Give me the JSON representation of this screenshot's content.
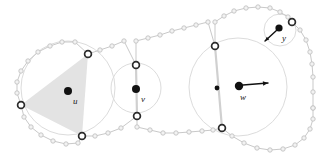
{
  "figure": {
    "kind": "geometric-diagram",
    "background_color": "#ffffff",
    "width": 321,
    "height": 155
  },
  "colors": {
    "boundary_stroke": "#c9c9c9",
    "small_vertex_stroke": "#c2c2c2",
    "small_vertex_fill": "#f2f2f2",
    "major_vertex_stroke": "#2b2b2b",
    "major_vertex_fill": "#ffffff",
    "disk_stroke": "#dcdcdc",
    "shaded_triangle_fill": "#e3e3e3",
    "chord_stroke": "#d0d0d0",
    "marker_fill": "#111111",
    "arrow_stroke": "#111111",
    "label_color": "#1a1a1a"
  },
  "labels": {
    "u": "u",
    "v": "v",
    "w": "w",
    "y": "y"
  },
  "points": {
    "u": {
      "label": "u",
      "x": 68,
      "y": 91,
      "radius": 4.0,
      "label_x": 73,
      "label_y": 97
    },
    "v": {
      "label": "v",
      "x": 136,
      "y": 89,
      "radius": 4.0,
      "label_x": 141,
      "label_y": 95
    },
    "w": {
      "label": "w",
      "x": 239,
      "y": 86,
      "radius": 4.2,
      "label_x": 240,
      "label_y": 93
    },
    "y": {
      "label": "y",
      "x": 279,
      "y": 28,
      "radius": 3.6,
      "label_x": 282,
      "label_y": 34
    },
    "w_secondary": {
      "label": "",
      "x": 217,
      "y": 88,
      "radius": 2.4
    }
  },
  "arrows": [
    {
      "name": "w-vector",
      "from_x": 243,
      "from_y": 85,
      "to_x": 268,
      "to_y": 83,
      "head_size": 5.5
    },
    {
      "name": "y-vector",
      "from_x": 277,
      "from_y": 30,
      "to_x": 265,
      "to_y": 41,
      "head_size": 4.5
    }
  ],
  "disks": [
    {
      "name": "disk-u",
      "cx": 68,
      "cy": 88,
      "r": 47
    },
    {
      "name": "disk-v",
      "cx": 136,
      "cy": 88,
      "r": 25
    },
    {
      "name": "disk-w",
      "cx": 238,
      "cy": 87,
      "r": 49
    },
    {
      "name": "disk-y",
      "cx": 280,
      "cy": 30,
      "r": 16
    }
  ],
  "major_vertices": [
    {
      "name": "vertex-left",
      "x": 21,
      "y": 105
    },
    {
      "name": "vertex-upper-left",
      "x": 88,
      "y": 54
    },
    {
      "name": "vertex-lower-left",
      "x": 82,
      "y": 136
    },
    {
      "name": "vertex-mid-top",
      "x": 136,
      "y": 65
    },
    {
      "name": "vertex-mid-bottom",
      "x": 137,
      "y": 116
    },
    {
      "name": "vertex-upper-right",
      "x": 215,
      "y": 46
    },
    {
      "name": "vertex-lower-right",
      "x": 222,
      "y": 128
    },
    {
      "name": "vertex-y-top",
      "x": 292,
      "y": 22
    }
  ],
  "shaded_triangle": {
    "name": "shaded-triangle-u",
    "vertices": [
      [
        21,
        105
      ],
      [
        88,
        54
      ],
      [
        82,
        136
      ]
    ]
  },
  "chords": [
    {
      "name": "chord-v",
      "x1": 136,
      "y1": 65,
      "x2": 137,
      "y2": 116
    },
    {
      "name": "chord-w",
      "x1": 215,
      "y1": 46,
      "x2": 222,
      "y2": 128
    }
  ],
  "boundary_polyline_upper": [
    [
      21,
      105
    ],
    [
      17,
      93
    ],
    [
      17,
      82
    ],
    [
      21,
      71
    ],
    [
      28,
      61
    ],
    [
      38,
      52
    ],
    [
      50,
      46
    ],
    [
      62,
      42
    ],
    [
      75,
      42
    ],
    [
      88,
      54
    ],
    [
      100,
      50
    ],
    [
      112,
      46
    ],
    [
      124,
      41
    ],
    [
      136,
      65
    ],
    [
      136,
      41
    ],
    [
      148,
      38
    ],
    [
      160,
      35
    ],
    [
      172,
      31
    ],
    [
      184,
      28
    ],
    [
      196,
      25
    ],
    [
      208,
      22
    ],
    [
      215,
      46
    ],
    [
      215,
      22
    ],
    [
      224,
      16
    ],
    [
      234,
      11
    ],
    [
      246,
      8
    ],
    [
      258,
      7
    ],
    [
      270,
      8
    ],
    [
      280,
      12
    ],
    [
      288,
      17
    ],
    [
      292,
      22
    ]
  ],
  "boundary_polyline_lower": [
    [
      21,
      105
    ],
    [
      24,
      117
    ],
    [
      31,
      127
    ],
    [
      41,
      135
    ],
    [
      53,
      141
    ],
    [
      66,
      144
    ],
    [
      78,
      143
    ],
    [
      82,
      136
    ],
    [
      95,
      136
    ],
    [
      108,
      133
    ],
    [
      121,
      128
    ],
    [
      137,
      116
    ],
    [
      137,
      127
    ],
    [
      150,
      130
    ],
    [
      163,
      133
    ],
    [
      176,
      133
    ],
    [
      189,
      132
    ],
    [
      202,
      131
    ],
    [
      213,
      130
    ],
    [
      222,
      128
    ],
    [
      232,
      136
    ],
    [
      244,
      143
    ],
    [
      257,
      148
    ],
    [
      270,
      150
    ],
    [
      283,
      149
    ],
    [
      295,
      145
    ],
    [
      304,
      138
    ],
    [
      310,
      129
    ],
    [
      313,
      119
    ],
    [
      313,
      108
    ]
  ],
  "boundary_polyline_right": [
    [
      292,
      22
    ],
    [
      300,
      30
    ],
    [
      306,
      40
    ],
    [
      310,
      52
    ],
    [
      312,
      64
    ],
    [
      313,
      77
    ],
    [
      313,
      92
    ],
    [
      313,
      108
    ]
  ],
  "counts": {
    "disks": 4,
    "marked_points": 4,
    "major_vertices": 8,
    "arrows": 2
  }
}
